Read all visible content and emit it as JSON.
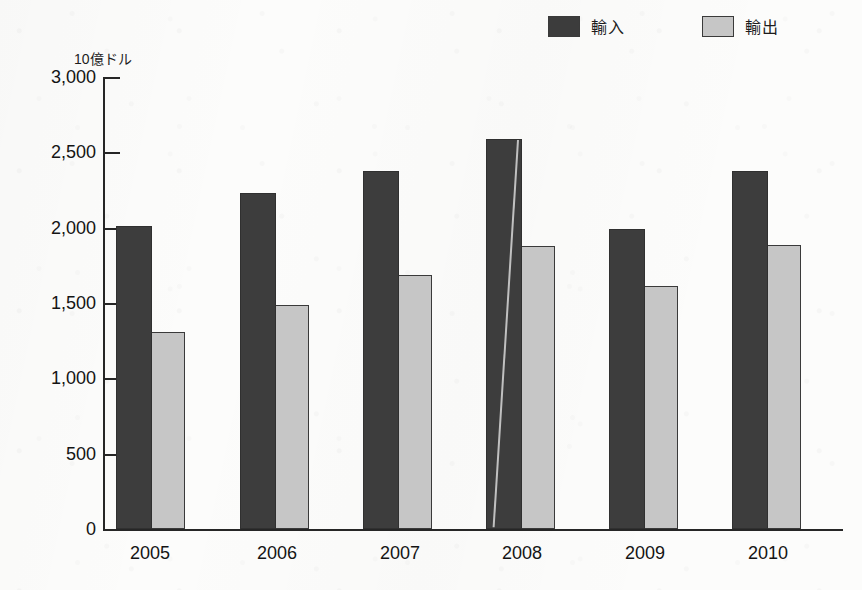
{
  "legend": {
    "position": "top-right",
    "entries": [
      {
        "label": "輸入",
        "swatch": "dark-square-swatch",
        "color": "#3c3c3c"
      },
      {
        "label": "輸出",
        "swatch": "light-square-swatch",
        "color": "#c6c6c6"
      }
    ]
  },
  "axis": {
    "unit_caption": "10億ドル",
    "y_tick_labels": [
      "3,000",
      "2,500",
      "2,000",
      "1,500",
      "1,000",
      "500",
      "0"
    ],
    "x_tick_labels": [
      "2005",
      "2006",
      "2007",
      "2008",
      "2009",
      "2010"
    ]
  },
  "chart_data": {
    "type": "bar",
    "title": "",
    "subtitle": "",
    "xlabel": "",
    "ylabel": "10億ドル",
    "categories": [
      "2005",
      "2006",
      "2007",
      "2008",
      "2009",
      "2010"
    ],
    "series": [
      {
        "name": "輸入",
        "color": "#3c3c3c",
        "values": [
          2010,
          2230,
          2375,
          2590,
          1990,
          2375
        ]
      },
      {
        "name": "輸出",
        "color": "#c6c6c6",
        "values": [
          1305,
          1485,
          1685,
          1880,
          1610,
          1885
        ]
      }
    ],
    "ylim": [
      0,
      3000
    ],
    "ytick_step": 500,
    "yticks": [
      0,
      500,
      1000,
      1500,
      2000,
      2500,
      3000
    ],
    "grid": false,
    "legend_position": "top-right"
  }
}
